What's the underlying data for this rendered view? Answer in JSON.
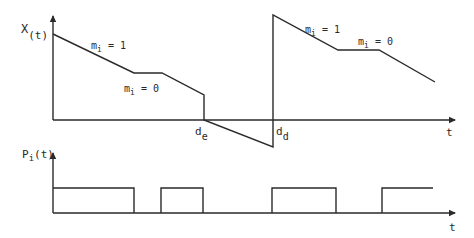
{
  "top_plot": {
    "y_label_main": "X",
    "y_label_sub": "(t)",
    "x_label": "t",
    "annotations": [
      {
        "id": "m1-first",
        "main": "m",
        "sub": "i",
        "rest": " = 1"
      },
      {
        "id": "m0-first",
        "main": "m",
        "sub": "i",
        "rest": " = 0"
      },
      {
        "id": "m1-second",
        "main": "m",
        "sub": "i",
        "rest": " = 1"
      },
      {
        "id": "m0-second",
        "main": "m",
        "sub": "i",
        "rest": " = 0"
      }
    ],
    "markers": [
      {
        "id": "de",
        "main": "d",
        "sub": "e"
      },
      {
        "id": "dd",
        "main": "d",
        "sub": "d"
      }
    ]
  },
  "bottom_plot": {
    "y_label_main": "P",
    "y_label_sub": "i",
    "y_label_rest": "(t)",
    "x_label": "t"
  },
  "colors": {
    "ink": "#2a2a2a",
    "background": "#ffffff"
  }
}
